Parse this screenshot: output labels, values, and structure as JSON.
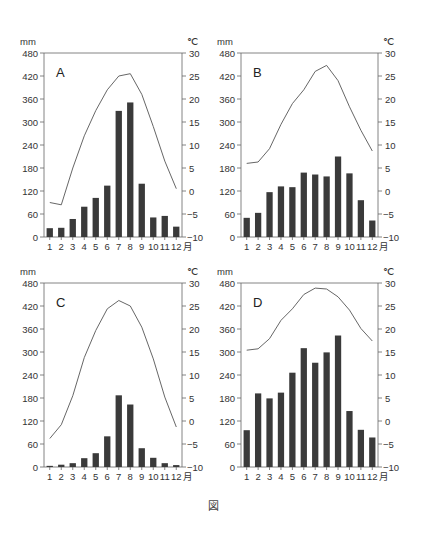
{
  "figure_caption": "図",
  "chart_data": [
    {
      "type": "bar+line",
      "title": "A",
      "xlabel": "月",
      "ylabel_left": "mm",
      "ylabel_right": "℃",
      "categories": [
        "1",
        "2",
        "3",
        "4",
        "5",
        "6",
        "7",
        "8",
        "9",
        "10",
        "11",
        "12"
      ],
      "left_ticks": [
        0,
        60,
        120,
        180,
        240,
        300,
        360,
        420,
        480
      ],
      "right_ticks": [
        -10,
        -5,
        0,
        5,
        10,
        15,
        20,
        25,
        30
      ],
      "ylim_left": [
        0,
        480
      ],
      "ylim_right": [
        -10,
        30
      ],
      "series": [
        {
          "name": "precipitation_mm",
          "kind": "bar",
          "values": [
            23,
            24,
            47,
            79,
            102,
            134,
            329,
            351,
            139,
            51,
            55,
            27
          ]
        },
        {
          "name": "temperature_c",
          "kind": "line",
          "values": [
            -2.5,
            -3.0,
            5.0,
            12.0,
            17.5,
            22.0,
            25.0,
            25.5,
            21.0,
            14.0,
            6.5,
            0.5
          ]
        }
      ]
    },
    {
      "type": "bar+line",
      "title": "B",
      "xlabel": "月",
      "ylabel_left": "mm",
      "ylabel_right": "℃",
      "categories": [
        "1",
        "2",
        "3",
        "4",
        "5",
        "6",
        "7",
        "8",
        "9",
        "10",
        "11",
        "12"
      ],
      "left_ticks": [
        0,
        60,
        120,
        180,
        240,
        300,
        360,
        420,
        480
      ],
      "right_ticks": [
        -10,
        -5,
        0,
        5,
        10,
        15,
        20,
        25,
        30
      ],
      "ylim_left": [
        0,
        480
      ],
      "ylim_right": [
        -10,
        30
      ],
      "series": [
        {
          "name": "precipitation_mm",
          "kind": "bar",
          "values": [
            50,
            63,
            117,
            132,
            130,
            168,
            163,
            158,
            210,
            166,
            96,
            43
          ]
        },
        {
          "name": "temperature_c",
          "kind": "line",
          "values": [
            6.0,
            6.3,
            9.2,
            14.5,
            19.0,
            22.0,
            26.0,
            27.3,
            24.0,
            18.3,
            13.2,
            8.7
          ]
        }
      ]
    },
    {
      "type": "bar+line",
      "title": "C",
      "xlabel": "月",
      "ylabel_left": "mm",
      "ylabel_right": "℃",
      "categories": [
        "1",
        "2",
        "3",
        "4",
        "5",
        "6",
        "7",
        "8",
        "9",
        "10",
        "11",
        "12"
      ],
      "left_ticks": [
        0,
        60,
        120,
        180,
        240,
        300,
        360,
        420,
        480
      ],
      "right_ticks": [
        -10,
        -5,
        0,
        5,
        10,
        15,
        20,
        25,
        30
      ],
      "ylim_left": [
        0,
        480
      ],
      "ylim_right": [
        -10,
        30
      ],
      "series": [
        {
          "name": "precipitation_mm",
          "kind": "bar",
          "values": [
            3,
            6,
            10,
            23,
            36,
            80,
            187,
            163,
            49,
            24,
            10,
            5
          ]
        },
        {
          "name": "temperature_c",
          "kind": "line",
          "values": [
            -3.8,
            -0.8,
            5.5,
            13.8,
            19.7,
            24.4,
            26.2,
            25.0,
            20.4,
            13.5,
            5.2,
            -1.3
          ]
        }
      ]
    },
    {
      "type": "bar+line",
      "title": "D",
      "xlabel": "月",
      "ylabel_left": "mm",
      "ylabel_right": "℃",
      "categories": [
        "1",
        "2",
        "3",
        "4",
        "5",
        "6",
        "7",
        "8",
        "9",
        "10",
        "11",
        "12"
      ],
      "left_ticks": [
        0,
        60,
        120,
        180,
        240,
        300,
        360,
        420,
        480
      ],
      "right_ticks": [
        -10,
        -5,
        0,
        5,
        10,
        15,
        20,
        25,
        30
      ],
      "ylim_left": [
        0,
        480
      ],
      "ylim_right": [
        -10,
        30
      ],
      "series": [
        {
          "name": "precipitation_mm",
          "kind": "bar",
          "values": [
            96,
            192,
            179,
            194,
            246,
            310,
            272,
            299,
            343,
            146,
            97,
            77
          ]
        },
        {
          "name": "temperature_c",
          "kind": "line",
          "values": [
            15.4,
            15.7,
            17.9,
            21.9,
            24.4,
            27.5,
            28.9,
            28.7,
            27.0,
            24.1,
            20.1,
            17.4
          ]
        }
      ]
    }
  ],
  "colors": {
    "bar": "#3a3a3a",
    "line": "#555555",
    "axis": "#666666",
    "text": "#333333"
  }
}
